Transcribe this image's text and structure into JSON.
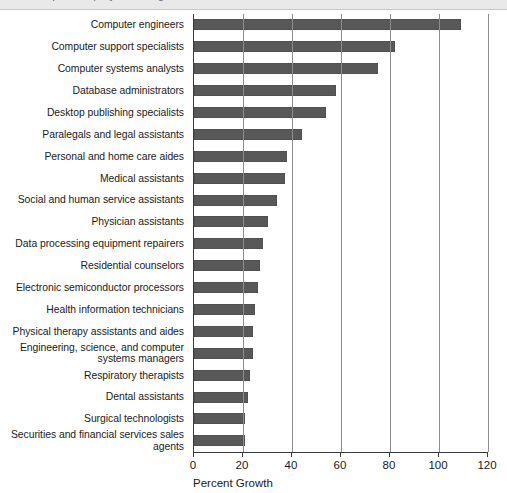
{
  "page": {
    "top_strip_clipped_text": "the occupations projected to grow the fastest"
  },
  "chart_data": {
    "type": "bar",
    "orientation": "horizontal",
    "title": "",
    "subtitle": "",
    "xlabel": "Percent Growth",
    "ylabel": "",
    "xlim": [
      0,
      120
    ],
    "xticks": [
      0,
      20,
      40,
      60,
      80,
      100,
      120
    ],
    "xticklabels": [
      "0",
      "20",
      "40",
      "60",
      "80",
      "100",
      "120"
    ],
    "grid": true,
    "grid_axis": "x",
    "legend": null,
    "bar_color": "#585858",
    "axis_color": "#3a3a3a",
    "gridline_color": "#8d8d8d",
    "categories": [
      "Computer engineers",
      "Computer support specialists",
      "Computer systems analysts",
      "Database administrators",
      "Desktop publishing specialists",
      "Paralegals and legal assistants",
      "Personal and home care aides",
      "Medical assistants",
      "Social and human service assistants",
      "Physician assistants",
      "Data processing equipment repairers",
      "Residential counselors",
      "Electronic semiconductor processors",
      "Health information technicians",
      "Physical therapy assistants and aides",
      "Engineering, science, and computer systems managers",
      "Respiratory therapists",
      "Dental assistants",
      "Surgical technologists",
      "Securities and financial services sales agents"
    ],
    "values": [
      109,
      82,
      75,
      58,
      54,
      44,
      38,
      37,
      34,
      30,
      28,
      27,
      26,
      25,
      24,
      24,
      23,
      22,
      21,
      21
    ]
  }
}
